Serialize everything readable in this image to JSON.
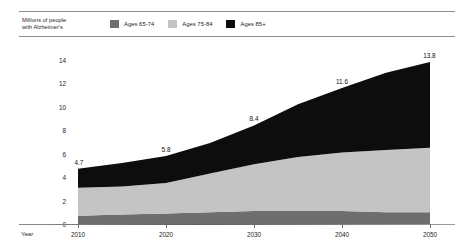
{
  "legend": {
    "axis_title_line1": "Millions of people",
    "axis_title_line2": "with Alzheimer's",
    "items": [
      {
        "label": "Ages 65-74",
        "color": "#6e6e6e",
        "icon": "legend-swatch-icon"
      },
      {
        "label": "Ages 75-84",
        "color": "#c4c4c4",
        "icon": "legend-swatch-icon"
      },
      {
        "label": "Ages 85+",
        "color": "#0d0d0d",
        "icon": "legend-swatch-icon"
      }
    ]
  },
  "axes": {
    "x_axis_name": "Year",
    "y_ticks": [
      "0",
      "2",
      "4",
      "6",
      "8",
      "10",
      "12",
      "14"
    ],
    "x_ticks": [
      "2010",
      "2020",
      "2030",
      "2040",
      "2050"
    ]
  },
  "callouts": [
    {
      "value": "4.7",
      "year": 2010
    },
    {
      "value": "5.8",
      "year": 2020
    },
    {
      "value": "8.4",
      "year": 2030
    },
    {
      "value": "11.6",
      "year": 2040
    },
    {
      "value": "13.8",
      "year": 2050
    }
  ],
  "chart_data": {
    "type": "area",
    "title": "",
    "subtitle": "",
    "xlabel": "Year",
    "ylabel": "Millions of people with Alzheimer's",
    "xlim": [
      2010,
      2050
    ],
    "ylim": [
      0,
      15
    ],
    "grid": false,
    "legend_position": "top",
    "stacked": true,
    "x": [
      2010,
      2015,
      2020,
      2025,
      2030,
      2035,
      2040,
      2045,
      2050
    ],
    "series": [
      {
        "name": "Ages 65-74",
        "color": "#6e6e6e",
        "values": [
          0.7,
          0.8,
          0.9,
          1.0,
          1.1,
          1.1,
          1.1,
          1.0,
          1.0
        ]
      },
      {
        "name": "Ages 75-84",
        "color": "#c4c4c4",
        "values": [
          2.4,
          2.4,
          2.6,
          3.3,
          4.0,
          4.6,
          5.0,
          5.3,
          5.5
        ]
      },
      {
        "name": "Ages 85+",
        "color": "#0d0d0d",
        "values": [
          1.6,
          2.0,
          2.3,
          2.6,
          3.3,
          4.5,
          5.5,
          6.6,
          7.3
        ]
      }
    ],
    "totals": [
      4.7,
      5.2,
      5.8,
      6.9,
      8.4,
      10.2,
      11.6,
      12.9,
      13.8
    ],
    "annotations": [
      {
        "x": 2010,
        "y": 4.7,
        "text": "4.7"
      },
      {
        "x": 2020,
        "y": 5.8,
        "text": "5.8"
      },
      {
        "x": 2030,
        "y": 8.4,
        "text": "8.4"
      },
      {
        "x": 2040,
        "y": 11.6,
        "text": "11.6"
      },
      {
        "x": 2050,
        "y": 13.8,
        "text": "13.8"
      }
    ]
  }
}
